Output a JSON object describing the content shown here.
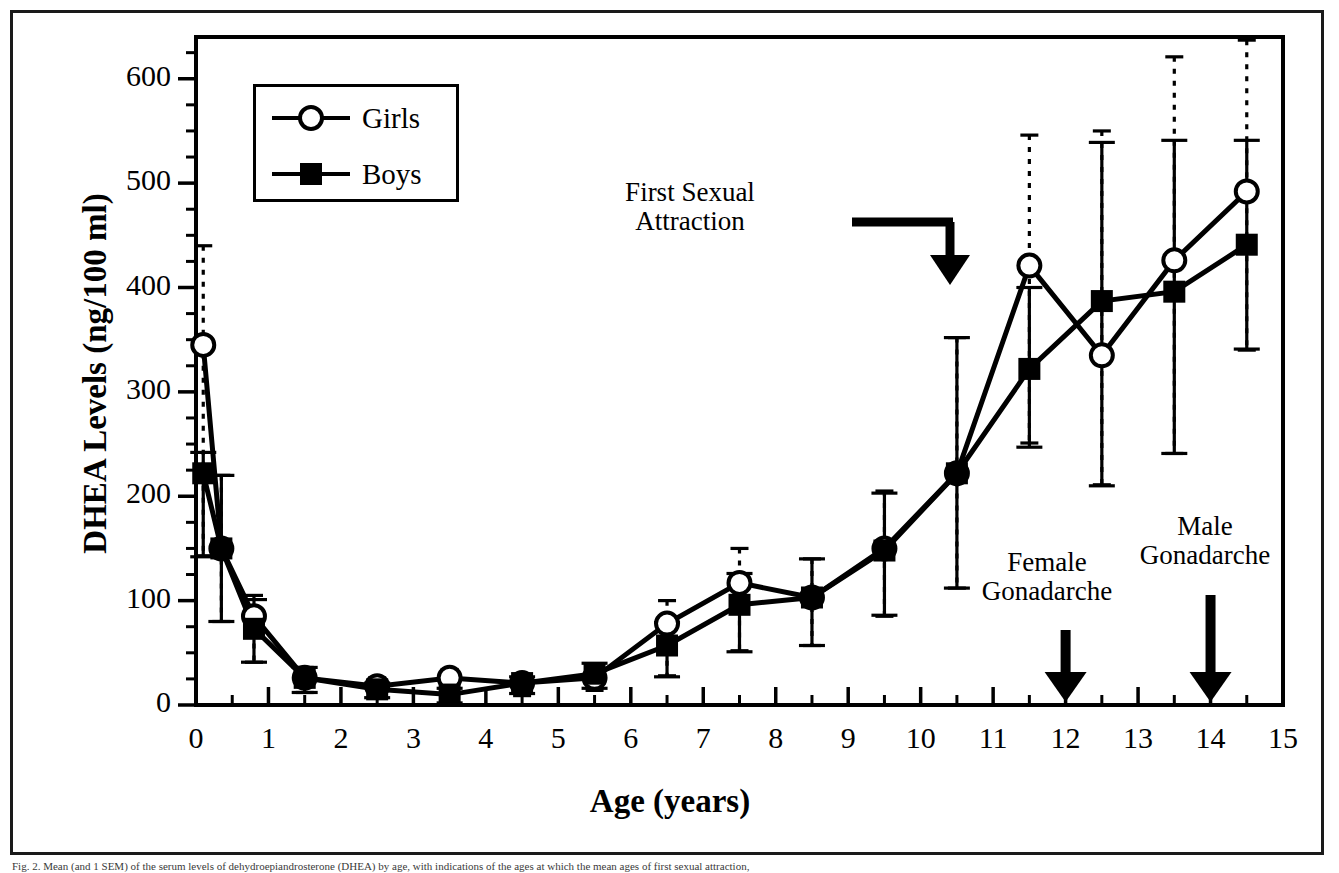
{
  "figure": {
    "caption": "Fig. 2. Mean (and 1 SEM) of the serum levels of dehydroepiandrosterone (DHEA) by age, with indications of the ages at which the mean ages of first sexual attraction,"
  },
  "chart_data": {
    "type": "line",
    "title": "",
    "xlabel": "Age (years)",
    "ylabel": "DHEA Levels (ng/100 ml)",
    "xlim": [
      0,
      15
    ],
    "ylim": [
      0,
      640
    ],
    "xticks": [
      0,
      1,
      2,
      3,
      4,
      5,
      6,
      7,
      8,
      9,
      10,
      11,
      12,
      13,
      14,
      15
    ],
    "xtick_labels": [
      "0",
      "1",
      "2",
      "3",
      "4",
      "5",
      "6",
      "7",
      "8",
      "9",
      "10",
      "11",
      "12",
      "13",
      "14",
      "15"
    ],
    "xminor_step": 0.5,
    "yticks": [
      0,
      100,
      200,
      300,
      400,
      500,
      600
    ],
    "ytick_labels": [
      "0",
      "100",
      "200",
      "300",
      "400",
      "500",
      "600"
    ],
    "yminor_step": 25,
    "grid": false,
    "legend_position": "top-left",
    "series": [
      {
        "name": "Girls",
        "marker": "open-circle",
        "errorbar_style": "dotted",
        "x": [
          0.1,
          0.35,
          0.8,
          1.5,
          2.5,
          3.5,
          4.5,
          5.5,
          6.5,
          7.5,
          8.5,
          9.5,
          10.5,
          11.5,
          12.5,
          13.5,
          14.5
        ],
        "values": [
          345,
          150,
          85,
          26,
          18,
          26,
          21,
          26,
          78,
          117,
          103,
          150,
          222,
          421,
          335,
          426,
          492
        ],
        "err_low": [
          202,
          70,
          44,
          14,
          10,
          14,
          12,
          12,
          50,
          65,
          46,
          65,
          110,
          170,
          124,
          185,
          152
        ],
        "err_high": [
          95,
          70,
          20,
          10,
          8,
          8,
          8,
          12,
          22,
          33,
          37,
          55,
          130,
          125,
          215,
          195,
          145
        ]
      },
      {
        "name": "Boys",
        "marker": "filled-square",
        "errorbar_style": "solid",
        "x": [
          0.1,
          0.35,
          0.8,
          1.5,
          2.5,
          3.5,
          4.5,
          5.5,
          6.5,
          7.5,
          8.5,
          9.5,
          10.5,
          11.5,
          12.5,
          13.5,
          14.5
        ],
        "values": [
          222,
          150,
          73,
          26,
          15,
          10,
          21,
          30,
          57,
          96,
          103,
          148,
          222,
          322,
          387,
          396,
          441
        ],
        "err_low": [
          80,
          70,
          32,
          14,
          8,
          8,
          10,
          14,
          30,
          45,
          46,
          62,
          110,
          75,
          177,
          155,
          100
        ],
        "err_high": [
          20,
          70,
          28,
          10,
          6,
          6,
          6,
          10,
          22,
          30,
          37,
          55,
          130,
          78,
          152,
          145,
          100
        ]
      }
    ],
    "annotations": [
      {
        "text_line1": "First Sexual",
        "text_line2": "Attraction",
        "arrow": "down",
        "target_x": 10.1,
        "target_y": 420
      },
      {
        "text_line1": "Female",
        "text_line2": "Gonadarche",
        "arrow": "down",
        "target_x": 12,
        "target_y": 0
      },
      {
        "text_line1": "Male",
        "text_line2": "Gonadarche",
        "arrow": "down",
        "target_x": 14,
        "target_y": 0
      }
    ]
  },
  "legend": {
    "items": [
      {
        "label": "Girls",
        "marker": "open-circle"
      },
      {
        "label": "Boys",
        "marker": "filled-square"
      }
    ]
  }
}
